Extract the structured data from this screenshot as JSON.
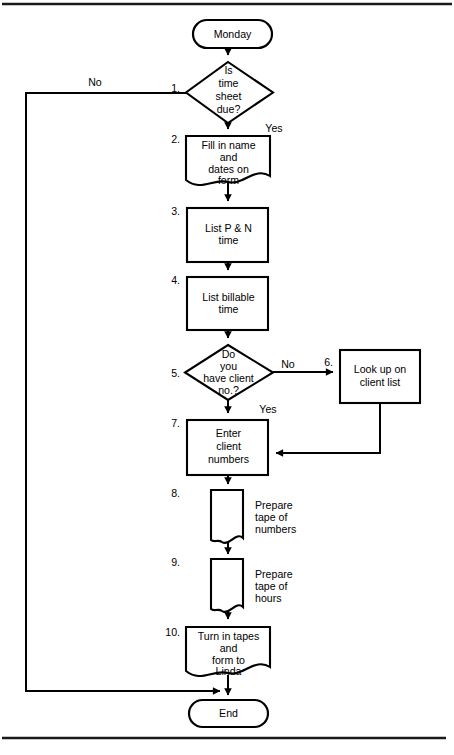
{
  "figure": {
    "type": "flowchart",
    "orientation": "vertical"
  },
  "start_node": {
    "label": "Monday",
    "shape": "terminator"
  },
  "end_node": {
    "label": "End",
    "shape": "terminator"
  },
  "steps": [
    {
      "number": "1.",
      "shape": "decision",
      "lines": [
        "Is",
        "time",
        "sheet",
        "due?"
      ],
      "yes_label": "Yes",
      "no_label": "No"
    },
    {
      "number": "2.",
      "shape": "document",
      "lines": [
        "Fill in name",
        "and",
        "dates on",
        "form"
      ]
    },
    {
      "number": "3.",
      "shape": "process",
      "lines": [
        "List P & N",
        "time"
      ]
    },
    {
      "number": "4.",
      "shape": "process",
      "lines": [
        "List billable",
        "time"
      ]
    },
    {
      "number": "5.",
      "shape": "decision",
      "lines": [
        "Do",
        "you",
        "have client",
        "no.?"
      ],
      "yes_label": "Yes",
      "no_label": "No"
    },
    {
      "number": "6.",
      "shape": "process",
      "lines": [
        "Look up on",
        "client list"
      ]
    },
    {
      "number": "7.",
      "shape": "process",
      "lines": [
        "Enter",
        "client",
        "numbers"
      ]
    },
    {
      "number": "8.",
      "shape": "tape",
      "side_lines": [
        "Prepare",
        "tape of",
        "numbers"
      ]
    },
    {
      "number": "9.",
      "shape": "tape",
      "side_lines": [
        "Prepare",
        "tape of",
        "hours"
      ]
    },
    {
      "number": "10.",
      "shape": "document",
      "lines": [
        "Turn in tapes",
        "and",
        "form to",
        "Linda"
      ]
    }
  ],
  "colors": {
    "stroke": "#000000",
    "fill": "#ffffff",
    "rule": "#1a1a1a",
    "background": "#ffffff"
  }
}
